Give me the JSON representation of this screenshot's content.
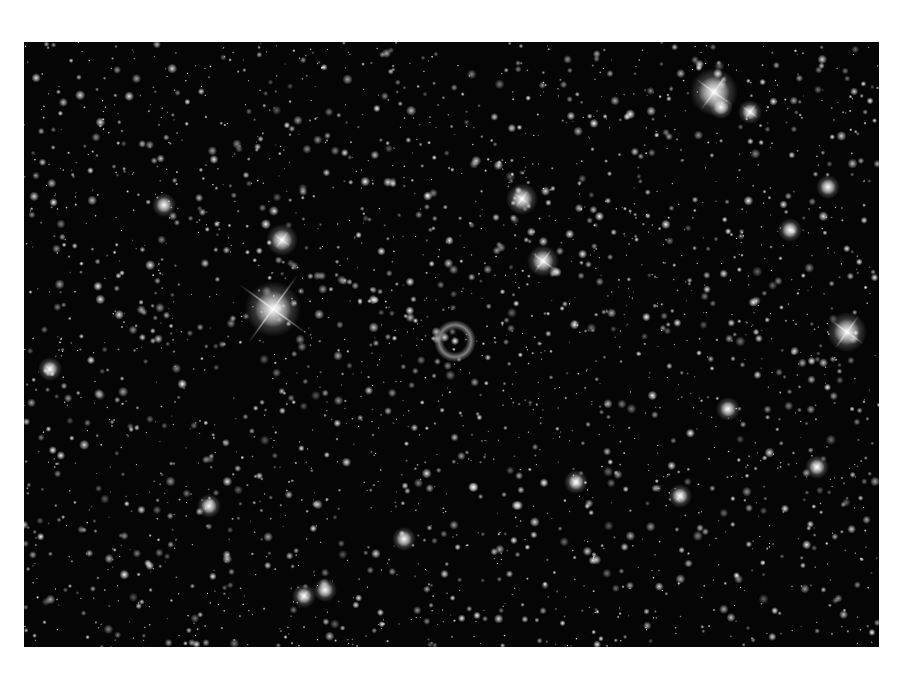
{
  "image": {
    "subject": "starfield with ring planetary nebula",
    "frame": {
      "x": 24,
      "y": 42,
      "width": 855,
      "height": 605
    },
    "background_color": "#050505",
    "page_background": "#ffffff"
  },
  "nebula": {
    "x": 431,
    "y": 299,
    "radius": 16,
    "ring_width": 5,
    "color": "#9a9a9a"
  },
  "bright_stars": [
    {
      "x": 249,
      "y": 267,
      "r": 7,
      "spike": 42
    },
    {
      "x": 690,
      "y": 50,
      "r": 6,
      "spike": 22
    },
    {
      "x": 519,
      "y": 219,
      "r": 4,
      "spike": 14
    },
    {
      "x": 498,
      "y": 157,
      "r": 4,
      "spike": 10
    },
    {
      "x": 823,
      "y": 290,
      "r": 5,
      "spike": 20
    },
    {
      "x": 258,
      "y": 198,
      "r": 4,
      "spike": 10
    },
    {
      "x": 726,
      "y": 70,
      "r": 3,
      "spike": 10
    },
    {
      "x": 697,
      "y": 65,
      "r": 3,
      "spike": 0
    },
    {
      "x": 26,
      "y": 327,
      "r": 3,
      "spike": 6
    },
    {
      "x": 280,
      "y": 554,
      "r": 3,
      "spike": 6
    },
    {
      "x": 552,
      "y": 440,
      "r": 3,
      "spike": 6
    },
    {
      "x": 656,
      "y": 454,
      "r": 3,
      "spike": 6
    },
    {
      "x": 793,
      "y": 425,
      "r": 3,
      "spike": 6
    },
    {
      "x": 704,
      "y": 367,
      "r": 3,
      "spike": 0
    },
    {
      "x": 766,
      "y": 188,
      "r": 3,
      "spike": 0
    },
    {
      "x": 380,
      "y": 497,
      "r": 3,
      "spike": 0
    },
    {
      "x": 185,
      "y": 464,
      "r": 3,
      "spike": 0
    },
    {
      "x": 140,
      "y": 163,
      "r": 3,
      "spike": 0
    },
    {
      "x": 804,
      "y": 145,
      "r": 3,
      "spike": 0
    },
    {
      "x": 301,
      "y": 548,
      "r": 3,
      "spike": 0
    }
  ],
  "field": {
    "seed": 1337,
    "count": 2600,
    "max_radius": 1.6
  }
}
